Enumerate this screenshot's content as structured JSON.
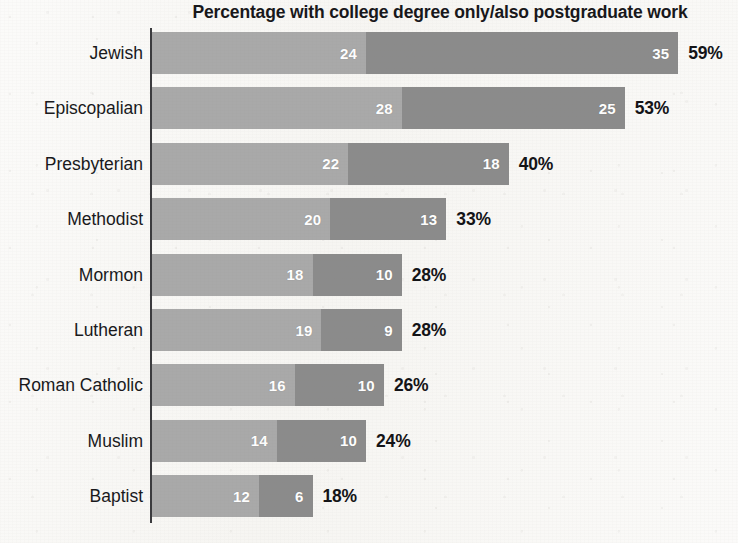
{
  "chart_data": {
    "type": "bar",
    "subtype": "stacked-horizontal",
    "title": "Percentage with college degree only/also postgraduate work",
    "xlabel": "",
    "ylabel": "",
    "xlim": [
      0,
      59
    ],
    "grid": false,
    "legend": "none",
    "categories": [
      "Jewish",
      "Episcopalian",
      "Presbyterian",
      "Methodist",
      "Mormon",
      "Lutheran",
      "Roman Catholic",
      "Muslim",
      "Baptist"
    ],
    "series": [
      {
        "name": "college degree only",
        "values": [
          24,
          28,
          22,
          20,
          18,
          19,
          16,
          14,
          12
        ]
      },
      {
        "name": "also postgraduate work",
        "values": [
          35,
          25,
          18,
          13,
          10,
          9,
          10,
          10,
          6
        ]
      }
    ],
    "totals": [
      59,
      53,
      40,
      33,
      28,
      28,
      26,
      24,
      18
    ],
    "total_labels": [
      "59%",
      "53%",
      "40%",
      "33%",
      "28%",
      "28%",
      "26%",
      "24%",
      "18%"
    ],
    "rows": [
      {
        "label": "Jewish",
        "first": 24,
        "second": 35,
        "total": 59,
        "first_label": "24",
        "second_label": "35",
        "total_label": "59%"
      },
      {
        "label": "Episcopalian",
        "first": 28,
        "second": 25,
        "total": 53,
        "first_label": "28",
        "second_label": "25",
        "total_label": "53%"
      },
      {
        "label": "Presbyterian",
        "first": 22,
        "second": 18,
        "total": 40,
        "first_label": "22",
        "second_label": "18",
        "total_label": "40%"
      },
      {
        "label": "Methodist",
        "first": 20,
        "second": 13,
        "total": 33,
        "first_label": "20",
        "second_label": "13",
        "total_label": "33%"
      },
      {
        "label": "Mormon",
        "first": 18,
        "second": 10,
        "total": 28,
        "first_label": "18",
        "second_label": "10",
        "total_label": "28%"
      },
      {
        "label": "Lutheran",
        "first": 19,
        "second": 9,
        "total": 28,
        "first_label": "19",
        "second_label": "9",
        "total_label": "28%"
      },
      {
        "label": "Roman Catholic",
        "first": 16,
        "second": 10,
        "total": 26,
        "first_label": "16",
        "second_label": "10",
        "total_label": "26%"
      },
      {
        "label": "Muslim",
        "first": 14,
        "second": 10,
        "total": 24,
        "first_label": "14",
        "second_label": "10",
        "total_label": "24%"
      },
      {
        "label": "Baptist",
        "first": 12,
        "second": 6,
        "total": 18,
        "first_label": "12",
        "second_label": "6",
        "total_label": "18%"
      }
    ],
    "colors": {
      "segment_first": "#a9a9a9",
      "segment_second": "#8b8b8b",
      "axis": "#3b3b3e",
      "text": "#18181b",
      "segment_value_text": "#ffffff",
      "background": "#f7f6f3"
    }
  },
  "layout": {
    "px_per_percent": 8.92,
    "bar_start_x": 152,
    "bar_height": 42,
    "row_pitch": 55.4,
    "first_row_top": 32
  }
}
